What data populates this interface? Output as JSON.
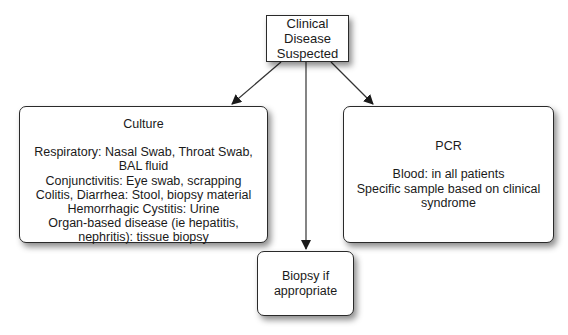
{
  "diagram": {
    "root": {
      "lines": [
        "Clinical",
        "Disease",
        "Suspected"
      ]
    },
    "culture": {
      "title": "Culture",
      "lines": [
        "Respiratory:  Nasal Swab, Throat Swab,",
        "BAL fluid",
        "Conjunctivitis:  Eye swab, scrapping",
        "Colitis, Diarrhea:  Stool, biopsy material",
        "Hemorrhagic Cystitis:  Urine",
        "Organ-based disease (ie hepatitis,",
        "nephritis):  tissue biopsy"
      ]
    },
    "pcr": {
      "title": "PCR",
      "lines": [
        "Blood: in all patients",
        "Specific sample based on clinical",
        "syndrome"
      ]
    },
    "biopsy": {
      "lines": [
        "Biopsy if",
        "appropriate"
      ]
    },
    "edges": [
      {
        "from": "root",
        "to": "culture"
      },
      {
        "from": "root",
        "to": "biopsy"
      },
      {
        "from": "root",
        "to": "pcr"
      }
    ]
  }
}
